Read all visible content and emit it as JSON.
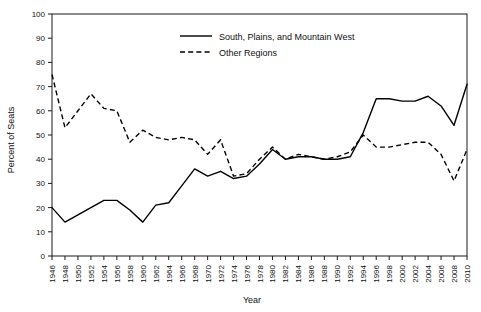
{
  "chart_data": {
    "type": "line",
    "title": "",
    "xlabel": "Year",
    "ylabel": "Percent of Seats",
    "xlim": [
      1946,
      2010
    ],
    "ylim": [
      0,
      100
    ],
    "ytick_step": 10,
    "xtick_step": 2,
    "grid": false,
    "legend_position": "top-center",
    "categories": [
      1946,
      1948,
      1950,
      1952,
      1954,
      1956,
      1958,
      1960,
      1962,
      1964,
      1966,
      1968,
      1970,
      1972,
      1974,
      1976,
      1978,
      1980,
      1982,
      1984,
      1986,
      1988,
      1990,
      1992,
      1994,
      1996,
      1998,
      2000,
      2002,
      2004,
      2006,
      2008,
      2010
    ],
    "xtick_labels": [
      "1946",
      "1948",
      "1950",
      "1952",
      "1954",
      "1956",
      "1958",
      "1960",
      "1962",
      "1964",
      "1966",
      "1968",
      "1970",
      "1972",
      "1974",
      "1976",
      "1978",
      "1980",
      "1982",
      "1984",
      "1986",
      "1988",
      "1990",
      "1992",
      "1994",
      "1996",
      "1998",
      "2000",
      "2002",
      "2004",
      "2006",
      "2008",
      "2010"
    ],
    "ytick_labels": [
      "0",
      "10",
      "20",
      "30",
      "40",
      "50",
      "60",
      "70",
      "80",
      "90",
      "100"
    ],
    "series": [
      {
        "name": "South, Plains, and Mountain West",
        "style": "solid",
        "color": "#000000",
        "values": [
          20,
          14,
          17,
          20,
          23,
          23,
          19,
          14,
          21,
          22,
          29,
          36,
          33,
          35,
          32,
          33,
          38,
          44,
          40,
          41,
          41,
          40,
          40,
          41,
          51,
          65,
          65,
          64,
          64,
          66,
          62,
          54,
          71
        ]
      },
      {
        "name": "Other Regions",
        "style": "dashed",
        "color": "#000000",
        "values": [
          75,
          53,
          60,
          67,
          61,
          60,
          47,
          52,
          49,
          48,
          49,
          48,
          42,
          48,
          33,
          34,
          40,
          45,
          40,
          42,
          41,
          40,
          41,
          43,
          50,
          45,
          45,
          46,
          47,
          47,
          42,
          31,
          44
        ]
      }
    ],
    "legend": [
      {
        "label": "South, Plains, and Mountain West",
        "style": "solid"
      },
      {
        "label": "Other Regions",
        "style": "dashed"
      }
    ]
  }
}
